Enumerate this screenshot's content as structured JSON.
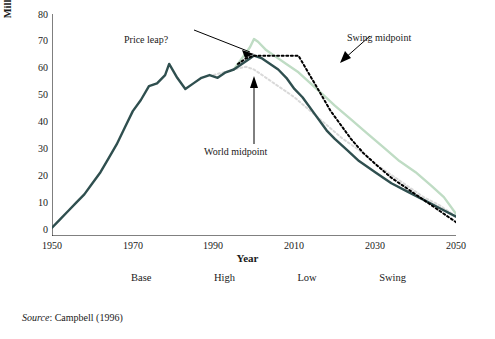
{
  "chart_data": {
    "type": "line",
    "title": "",
    "xlabel": "Year",
    "ylabel": "Million barrels per day (mb/d)",
    "xlim": [
      1950,
      2050
    ],
    "ylim": [
      0,
      80
    ],
    "xticks": [
      1950,
      1970,
      1990,
      2010,
      2030,
      2050
    ],
    "yticks": [
      0,
      10,
      20,
      30,
      40,
      50,
      60,
      70,
      80
    ],
    "grid": false,
    "legend_position": "bottom",
    "series": [
      {
        "name": "Base",
        "color": "#2f4f4f",
        "style": "solid",
        "x": [
          1950,
          1952,
          1954,
          1956,
          1958,
          1960,
          1962,
          1964,
          1966,
          1968,
          1970,
          1972,
          1974,
          1976,
          1978,
          1979,
          1981,
          1983,
          1985,
          1987,
          1989,
          1991,
          1993,
          1995,
          1997,
          1999,
          2000,
          2002,
          2004,
          2006,
          2008,
          2010,
          2012,
          2015,
          2018,
          2020,
          2023,
          2026,
          2030,
          2034,
          2038,
          2042,
          2046,
          2050
        ],
        "y": [
          3,
          6,
          9,
          12,
          15,
          19,
          23,
          28,
          33,
          39,
          45,
          49,
          54,
          55,
          58,
          62,
          57,
          53,
          55,
          57,
          58,
          57,
          59,
          60,
          62,
          64,
          65,
          64,
          62,
          60,
          57,
          53,
          50,
          44,
          38,
          35,
          31,
          27,
          23,
          19,
          16,
          13,
          10,
          7
        ]
      },
      {
        "name": "High",
        "color": "#bfdcc4",
        "style": "solid",
        "x": [
          1995,
          1997,
          1999,
          2000,
          2001,
          2003,
          2005,
          2008,
          2011,
          2014,
          2017,
          2020,
          2024,
          2028,
          2032,
          2036,
          2040,
          2044,
          2047,
          2050
        ],
        "y": [
          60,
          64,
          68,
          71,
          70,
          67,
          65,
          62,
          59,
          55,
          51,
          47,
          42,
          37,
          32,
          27,
          23,
          18,
          14,
          8
        ]
      },
      {
        "name": "Low",
        "color": "#d9d9d9",
        "style": "dotted",
        "x": [
          1990,
          1995,
          1998,
          2000,
          2003,
          2006,
          2010,
          2014,
          2018,
          2022,
          2026,
          2030,
          2034,
          2038,
          2042,
          2046,
          2050
        ],
        "y": [
          58,
          60,
          61,
          60,
          57,
          54,
          50,
          45,
          40,
          35,
          31,
          26,
          22,
          18,
          14,
          11,
          7
        ]
      },
      {
        "name": "Swing",
        "color": "#000000",
        "style": "dotted",
        "x": [
          1996,
          1998,
          2000,
          2003,
          2006,
          2009,
          2011,
          2013,
          2015,
          2017,
          2019,
          2021,
          2024,
          2027,
          2030,
          2034,
          2038,
          2042,
          2046,
          2050
        ],
        "y": [
          62,
          64,
          65,
          65,
          65,
          65,
          65,
          60,
          55,
          50,
          45,
          41,
          35,
          30,
          26,
          21,
          17,
          13,
          9,
          5
        ]
      }
    ],
    "annotations": [
      {
        "id": "price-leap",
        "text": "Price leap?",
        "x": 1974,
        "y": 74
      },
      {
        "id": "swing-midpoint",
        "text": "Swing midpoint",
        "x": 2016,
        "y": 76
      },
      {
        "id": "world-midpoint",
        "text": "World midpoint",
        "x": 1996,
        "y": 33
      }
    ]
  },
  "legend": {
    "items": [
      {
        "label": "Base",
        "color": "#2f4f4f",
        "style": "solid"
      },
      {
        "label": "High",
        "color": "#bfdcc4",
        "style": "solid"
      },
      {
        "label": "Low",
        "color": "#d0d0d0",
        "style": "dotted"
      },
      {
        "label": "Swing",
        "color": "#000000",
        "style": "dotted"
      }
    ]
  },
  "axis": {
    "xlabel": "Year",
    "ylabel": "Million barrels per day (mb/d)",
    "xticks": [
      "1950",
      "1970",
      "1990",
      "2010",
      "2030",
      "2050"
    ],
    "yticks": [
      "80",
      "70",
      "60",
      "50",
      "40",
      "30",
      "20",
      "10",
      "0"
    ]
  },
  "annotations": {
    "price_leap": "Price leap?",
    "swing_midpoint": "Swing midpoint",
    "world_midpoint": "World midpoint"
  },
  "source": {
    "prefix": "Source",
    "text": ": Campbell (1996)"
  }
}
